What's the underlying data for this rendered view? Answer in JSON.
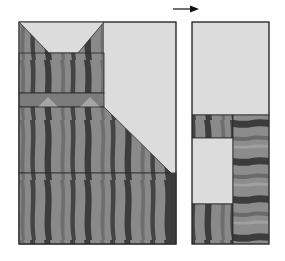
{
  "diagram": {
    "type": "quilt-block-assembly",
    "arrow": {
      "direction": "right",
      "icon": "arrow-right-icon"
    },
    "colors": {
      "background_fabric": "#dcdcdc",
      "stripe_light": "#8e8e8e",
      "stripe_mid": "#7a7a7a",
      "stripe_dark": "#3a3a3a",
      "outline": "#2a2a2a"
    },
    "left_panel": {
      "pieces": [
        "ears-row",
        "head",
        "chin-strip",
        "body-trapezoid",
        "base-strip",
        "background-large"
      ]
    },
    "right_panel": {
      "pieces": [
        "background-top",
        "small-striped-square",
        "background-square",
        "small-striped-bottom",
        "tail-strip"
      ]
    }
  }
}
